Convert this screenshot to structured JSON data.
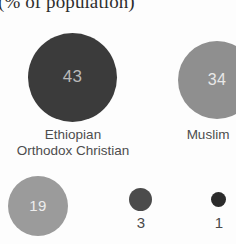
{
  "chart": {
    "title": "(% of population)"
  },
  "chart_data": {
    "type": "pie",
    "title": "(% of population)",
    "subtitle": "",
    "xlabel": "",
    "ylabel": "",
    "unit": "percent of population",
    "grid": false,
    "legend": "none",
    "labels_inside_bubbles": true,
    "categories": [
      "Ethiopian\nOrthodox Christian",
      "Muslim",
      "",
      "",
      ""
    ],
    "values": [
      43,
      34,
      19,
      3,
      1
    ],
    "bubbles": [
      {
        "name": "ethiopian-orthodox-christian",
        "label": "Ethiopian\nOrthodox Christian",
        "value": "43",
        "value_number": 43,
        "color": "#3b3b3b",
        "value_text_color": "#b9b9b9",
        "label_position": "below",
        "value_position": "inside"
      },
      {
        "name": "muslim",
        "label": "Muslim",
        "value": "34",
        "value_number": 34,
        "color": "#8f8f8f",
        "value_text_color": "#e8e8e8",
        "label_position": "below",
        "value_position": "inside"
      },
      {
        "name": "protestant",
        "label": "",
        "value": "19",
        "value_number": 19,
        "color": "#9b9b9b",
        "value_text_color": "#ededed",
        "label_position": "none",
        "value_position": "inside"
      },
      {
        "name": "traditional",
        "label": "",
        "value": "3",
        "value_number": 3,
        "color": "#4b4b4b",
        "value_text_color": "#4a4a4a",
        "label_position": "none",
        "value_position": "below"
      },
      {
        "name": "other",
        "label": "",
        "value": "1",
        "value_number": 1,
        "color": "#2b2b2b",
        "value_text_color": "#4a4a4a",
        "label_position": "none",
        "value_position": "below"
      }
    ]
  }
}
